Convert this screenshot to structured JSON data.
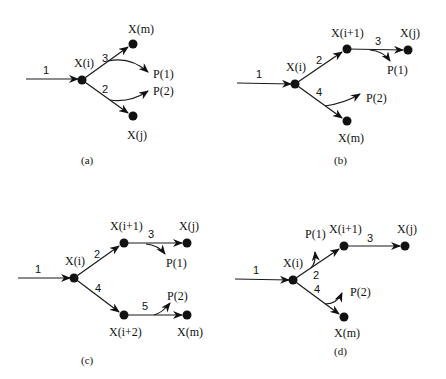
{
  "diagram": {
    "panels": [
      {
        "id": "a",
        "caption": "(a)",
        "edge_labels": {
          "e1": "1",
          "e2": "2",
          "e3": "3"
        },
        "nodes": {
          "xi": "X(i)",
          "xm": "X(m)",
          "xj": "X(j)"
        },
        "products": {
          "p1": "P(1)",
          "p2": "P(2)"
        }
      },
      {
        "id": "b",
        "caption": "(b)",
        "edge_labels": {
          "e1": "1",
          "e2": "2",
          "e3": "3",
          "e4": "4"
        },
        "nodes": {
          "xi": "X(i)",
          "xi1": "X(i+1)",
          "xj": "X(j)",
          "xm": "X(m)"
        },
        "products": {
          "p1": "P(1)",
          "p2": "P(2)"
        }
      },
      {
        "id": "c",
        "caption": "(c)",
        "edge_labels": {
          "e1": "1",
          "e2": "2",
          "e3": "3",
          "e4": "4",
          "e5": "5"
        },
        "nodes": {
          "xi": "X(i)",
          "xi1": "X(i+1)",
          "xj": "X(j)",
          "xi2": "X(i+2)",
          "xm": "X(m)"
        },
        "products": {
          "p1": "P(1)",
          "p2": "P(2)"
        }
      },
      {
        "id": "d",
        "caption": "(d)",
        "edge_labels": {
          "e1": "1",
          "e2": "2",
          "e3": "3",
          "e4": "4"
        },
        "nodes": {
          "xi": "X(i)",
          "xi1": "X(i+1)",
          "xj": "X(j)",
          "xm": "X(m)"
        },
        "products": {
          "p1": "P(1)",
          "p2": "P(2)"
        }
      }
    ]
  }
}
